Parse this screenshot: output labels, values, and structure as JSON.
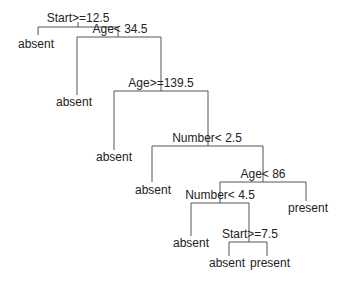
{
  "tree": {
    "splits": [
      {
        "id": "n1",
        "label": "Start>=12.5",
        "cx": 78,
        "y": 27,
        "left_x": 38,
        "right_x": 118,
        "label_y": 12
      },
      {
        "id": "n2",
        "label": "Age< 34.5",
        "cx": 118,
        "y": 37,
        "left_x": 77,
        "right_x": 161,
        "label_y": 22
      },
      {
        "id": "n3",
        "label": "Age>=139.5",
        "cx": 161,
        "y": 91,
        "left_x": 114,
        "right_x": 208,
        "label_y": 76
      },
      {
        "id": "n4",
        "label": "Number< 2.5",
        "cx": 208,
        "y": 146,
        "left_x": 152,
        "right_x": 263,
        "label_y": 131
      },
      {
        "id": "n5",
        "label": "Age< 86",
        "cx": 263,
        "y": 182,
        "left_x": 220,
        "right_x": 306,
        "label_y": 167
      },
      {
        "id": "n6",
        "label": "Number< 4.5",
        "cx": 220,
        "y": 203,
        "left_x": 191,
        "right_x": 249,
        "label_y": 188
      },
      {
        "id": "n7",
        "label": "Start>=7.5",
        "cx": 249,
        "y": 242,
        "left_x": 229,
        "right_x": 267,
        "label_y": 227
      }
    ],
    "leaves": [
      {
        "label": "absent",
        "x": 38,
        "y": 35,
        "label_y": 38
      },
      {
        "label": "absent",
        "x": 77,
        "y": 95,
        "label_y": 98
      },
      {
        "label": "absent",
        "x": 114,
        "y": 150,
        "label_y": 153
      },
      {
        "label": "absent",
        "x": 152,
        "y": 182,
        "label_y": 185
      },
      {
        "label": "present",
        "x": 306,
        "y": 201,
        "label_y": 204
      },
      {
        "label": "absent",
        "x": 191,
        "y": 236,
        "label_y": 239
      },
      {
        "label": "absent",
        "x": 229,
        "y": 256,
        "label_y": 258
      },
      {
        "label": "present",
        "x": 267,
        "y": 256,
        "label_y": 258
      }
    ]
  },
  "labels": {
    "n1": "Start>=12.5",
    "n2": "Age< 34.5",
    "n3": "Age>=139.5",
    "n4": "Number< 2.5",
    "n5": "Age< 86",
    "n6": "Number< 4.5",
    "n7": "Start>=7.5",
    "leaf1": "absent",
    "leaf2": "absent",
    "leaf3": "absent",
    "leaf4": "absent",
    "leaf5": "present",
    "leaf6": "absent",
    "leaf7": "absent",
    "leaf8": "present"
  },
  "colors": {
    "line": "#555555",
    "text": "#222222",
    "background": "#ffffff"
  }
}
